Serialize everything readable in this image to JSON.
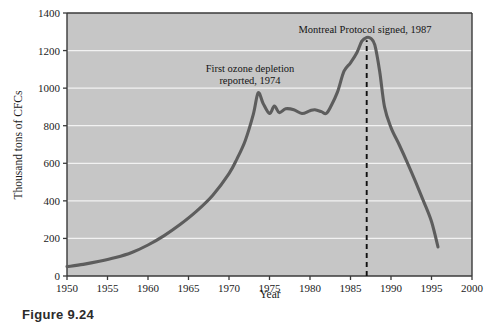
{
  "figure": {
    "caption": "Figure 9.24"
  },
  "chart_data": {
    "type": "line",
    "title": "",
    "xlabel": "Year",
    "ylabel": "Thousand tons of CFCs",
    "xlim": [
      1950,
      2000
    ],
    "ylim": [
      0,
      1400
    ],
    "xticks": [
      1950,
      1955,
      1960,
      1965,
      1970,
      1975,
      1980,
      1985,
      1990,
      1995,
      2000
    ],
    "yticks": [
      0,
      200,
      400,
      600,
      800,
      1000,
      1200,
      1400
    ],
    "grid": "horizontal",
    "legend": "none",
    "plot_bgcolor": "#c6c6c6",
    "gridline_color": "#f2f2f2",
    "line_color": "#5d5d5d",
    "series": [
      {
        "name": "CFC production",
        "x": [
          1950,
          1952,
          1954,
          1956,
          1958,
          1960,
          1962,
          1964,
          1966,
          1968,
          1970,
          1971,
          1972,
          1973,
          1973.6,
          1974.2,
          1975,
          1975.6,
          1976.2,
          1977,
          1978,
          1979,
          1980,
          1980.6,
          1981.4,
          1982,
          1982.6,
          1983.4,
          1984.2,
          1985,
          1985.8,
          1986.4,
          1987,
          1987.5,
          1988,
          1988.6,
          1989.2,
          1990,
          1991,
          1992,
          1993,
          1994,
          1995,
          1995.8
        ],
        "y": [
          50,
          62,
          78,
          98,
          125,
          165,
          215,
          275,
          345,
          430,
          545,
          625,
          720,
          860,
          975,
          920,
          865,
          905,
          870,
          890,
          885,
          865,
          880,
          885,
          875,
          865,
          905,
          980,
          1090,
          1135,
          1190,
          1250,
          1270,
          1265,
          1230,
          1090,
          900,
          790,
          700,
          605,
          505,
          400,
          290,
          155
        ]
      }
    ],
    "annotations": [
      {
        "name": "first-ozone-depletion",
        "lines": [
          "First ozone depletion",
          "reported, 1974"
        ],
        "x": 1974,
        "anchor_x_px": 250,
        "anchor_y_px": 72
      },
      {
        "name": "montreal-protocol",
        "lines": [
          "Montreal Protocol signed, 1987"
        ],
        "x": 1987,
        "anchor_x_px": 365,
        "anchor_y_px": 33
      }
    ],
    "vlines": [
      {
        "name": "montreal-protocol-marker",
        "x": 1987,
        "style": "dashed",
        "color": "#111111",
        "y_from": 0,
        "y_to": 1255
      }
    ]
  }
}
